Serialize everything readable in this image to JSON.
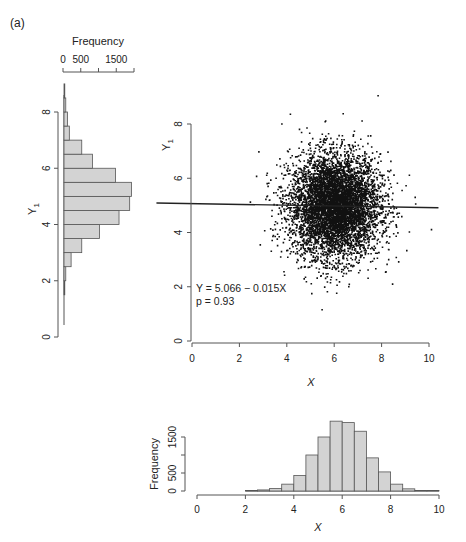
{
  "figure": {
    "panel_label": "(a)"
  },
  "colors": {
    "bar_fill": "#d3d3d3",
    "bar_stroke": "#555555",
    "axis": "#555555",
    "points": "#111111",
    "line": "#222222"
  },
  "chart_data": [
    {
      "id": "y-marginal-histogram",
      "type": "bar",
      "orientation": "horizontal",
      "title": "",
      "xlabel": "Frequency",
      "ylabel": "Y1",
      "xlim": [
        0,
        2000
      ],
      "ylim": [
        0,
        8.8
      ],
      "x_ticks": [
        0,
        500,
        1000,
        1500,
        2000
      ],
      "x_tick_labels": [
        "0",
        "500",
        "",
        "1500",
        ""
      ],
      "y_ticks": [
        0,
        2,
        4,
        6,
        8
      ],
      "y_tick_labels": [
        "0",
        "2",
        "4",
        "6",
        "8"
      ],
      "bin_edges": [
        1.5,
        2.0,
        2.5,
        3.0,
        3.5,
        4.0,
        4.5,
        5.0,
        5.5,
        6.0,
        6.5,
        7.0,
        7.5,
        8.0,
        8.5,
        9.0
      ],
      "values": [
        10,
        50,
        200,
        500,
        1000,
        1550,
        1850,
        1900,
        1450,
        800,
        500,
        150,
        100,
        50,
        10
      ],
      "grid": false
    },
    {
      "id": "scatter-x-y1",
      "type": "scatter",
      "title": "",
      "xlabel": "X",
      "ylabel": "Y1",
      "xlim": [
        0,
        10
      ],
      "ylim": [
        0,
        8
      ],
      "x_ticks": [
        0,
        2,
        4,
        6,
        8,
        10
      ],
      "x_tick_labels": [
        "0",
        "2",
        "4",
        "6",
        "8",
        "10"
      ],
      "y_ticks": [
        0,
        2,
        4,
        6,
        8
      ],
      "y_tick_labels": [
        "0",
        "2",
        "4",
        "6",
        "8"
      ],
      "n_points_approx": 10000,
      "x_mean": 6.0,
      "x_sd": 1.0,
      "y_mean": 5.0,
      "y_sd": 1.0,
      "regression": {
        "intercept": 5.066,
        "slope": -0.015,
        "x_range": [
          -1.5,
          10.4
        ]
      },
      "annotations": [
        "Y = 5.066 − 0.015X",
        "p = 0.93"
      ],
      "grid": false
    },
    {
      "id": "x-marginal-histogram",
      "type": "bar",
      "title": "",
      "xlabel": "X",
      "ylabel": "Frequency",
      "xlim": [
        0,
        10
      ],
      "ylim": [
        0,
        2000
      ],
      "x_ticks": [
        0,
        2,
        4,
        6,
        8,
        10
      ],
      "x_tick_labels": [
        "0",
        "2",
        "4",
        "6",
        "8",
        "10"
      ],
      "y_ticks": [
        0,
        500,
        1000,
        1500
      ],
      "y_tick_labels": [
        "0",
        "500",
        "",
        "1500"
      ],
      "bin_edges": [
        2.0,
        2.5,
        3.0,
        3.5,
        4.0,
        4.5,
        5.0,
        5.5,
        6.0,
        6.5,
        7.0,
        7.5,
        8.0,
        8.5,
        9.0,
        9.5,
        10.0
      ],
      "values": [
        5,
        30,
        70,
        190,
        430,
        1000,
        1500,
        1940,
        1900,
        1660,
        920,
        530,
        190,
        60,
        5,
        5
      ],
      "grid": false
    }
  ],
  "labels": {
    "top_hist_xlabel": "Frequency",
    "left_hist_ylabel": "Y",
    "left_hist_ylabel_sub": "1",
    "scatter_ylabel": "Y",
    "scatter_ylabel_sub": "1",
    "scatter_xlabel": "X",
    "bottom_hist_xlabel": "X",
    "bottom_hist_ylabel": "Frequency",
    "equation": "Y = 5.066 − 0.015X",
    "pvalue": "p = 0.93"
  }
}
